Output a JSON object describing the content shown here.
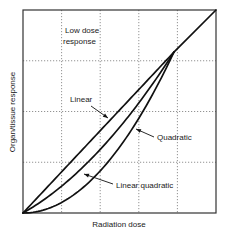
{
  "chart_data": {
    "type": "line",
    "title": "",
    "xlabel": "Radiation dose",
    "ylabel": "Organ/tissue response",
    "xlim": [
      0,
      5
    ],
    "ylim": [
      0,
      4
    ],
    "grid": true,
    "grid_x": [
      1,
      2,
      3,
      4
    ],
    "grid_y": [
      1,
      2,
      3
    ],
    "tick_labels_shown": false,
    "series": [
      {
        "name": "Linear",
        "model": "y = 0.811x",
        "x": [
          0,
          1,
          2,
          3,
          3.91
        ],
        "values": [
          0,
          0.81,
          1.62,
          2.43,
          3.17
        ]
      },
      {
        "name": "Linear quadratic",
        "model": "y = 0.433x + 0.097x^2",
        "x": [
          0,
          1,
          2,
          3,
          3.91
        ],
        "values": [
          0,
          0.53,
          1.25,
          2.17,
          3.17
        ]
      },
      {
        "name": "Quadratic",
        "model": "y = 0.207x^2",
        "x": [
          0,
          1,
          2,
          3,
          3.91
        ],
        "values": [
          0,
          0.21,
          0.83,
          1.86,
          3.17
        ]
      },
      {
        "name": "High dose (shared)",
        "x": [
          3.91,
          5
        ],
        "values": [
          3.17,
          4
        ]
      }
    ],
    "annotations": [
      {
        "text": "Low dose response",
        "lines": [
          "Low dose",
          "response"
        ]
      },
      {
        "text": "Linear",
        "points_to": "Linear"
      },
      {
        "text": "Quadratic",
        "points_to": "Quadratic"
      },
      {
        "text": "Linear quadratic",
        "points_to": "Linear quadratic"
      }
    ]
  }
}
